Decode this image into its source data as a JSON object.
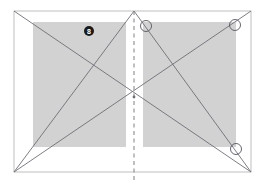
{
  "canvas": {
    "width": 265,
    "height": 185,
    "background": "#ffffff"
  },
  "colors": {
    "paper_fill": "#ffffff",
    "paper_border": "#b8b8b8",
    "shade_fill": "#d2d2d2",
    "crease_line": "#6e6e78",
    "dashed_line": "#808088",
    "marker_fill": "#1a1a1a",
    "marker_text": "#ffffff",
    "node_stroke": "#55555f",
    "node_fill": "none"
  },
  "paper": {
    "name": "outer-sheet",
    "x": 14,
    "y": 11,
    "width": 237,
    "height": 161
  },
  "shaded_panels": [
    {
      "name": "left-shaded-panel",
      "x": 33,
      "y": 22,
      "width": 93,
      "height": 125
    },
    {
      "name": "right-shaded-panel",
      "x": 143,
      "y": 22,
      "width": 93,
      "height": 125
    }
  ],
  "fold_line": {
    "name": "center-fold",
    "x": 134,
    "y1": 11,
    "y2": 182,
    "dash": "4,3.5"
  },
  "creases": [
    {
      "name": "crease-tl-br",
      "x1": 14,
      "y1": 11,
      "x2": 251,
      "y2": 172
    },
    {
      "name": "crease-bl-tr",
      "x1": 14,
      "y1": 172,
      "x2": 251,
      "y2": 11
    },
    {
      "name": "crease-bl-apex",
      "x1": 14,
      "y1": 172,
      "x2": 134,
      "y2": 11
    },
    {
      "name": "crease-apex-br",
      "x1": 134,
      "y1": 11,
      "x2": 251,
      "y2": 172
    }
  ],
  "nodes": [
    {
      "name": "node-upper-center",
      "cx": 146,
      "cy": 26,
      "r": 5.5
    },
    {
      "name": "node-upper-right",
      "cx": 235,
      "cy": 25,
      "r": 5.5
    },
    {
      "name": "node-lower-right",
      "cx": 236,
      "cy": 149,
      "r": 5.5
    }
  ],
  "markers": [
    {
      "name": "step-marker",
      "label": "8",
      "cx": 89,
      "cy": 31,
      "r": 5
    }
  ],
  "apex": {
    "name": "apex-point",
    "cx": 134,
    "cy": 11
  },
  "center": {
    "name": "center-point",
    "cx": 134,
    "cy": 97
  }
}
